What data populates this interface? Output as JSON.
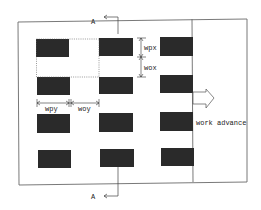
{
  "diagram": {
    "type": "mine panel layout (plan view)",
    "colors": {
      "pillar": "#2a2a2a",
      "line": "#6a6a6a",
      "background": "#ffffff"
    },
    "section_marker": {
      "top_label": "A",
      "bottom_label": "A"
    },
    "dimensions": {
      "wpx": "wpx",
      "wox": "wox",
      "wpy": "wpy",
      "woy": "woy"
    },
    "arrow_label": "work advance",
    "pillars": [
      {
        "row": 1,
        "col": 1
      },
      {
        "row": 1,
        "col": 2
      },
      {
        "row": 1,
        "col": 3
      },
      {
        "row": 2,
        "col": 1
      },
      {
        "row": 2,
        "col": 2
      },
      {
        "row": 2,
        "col": 3
      },
      {
        "row": 3,
        "col": 1
      },
      {
        "row": 3,
        "col": 2
      },
      {
        "row": 3,
        "col": 3
      },
      {
        "row": 4,
        "col": 1
      },
      {
        "row": 4,
        "col": 2
      },
      {
        "row": 4,
        "col": 3
      }
    ]
  }
}
